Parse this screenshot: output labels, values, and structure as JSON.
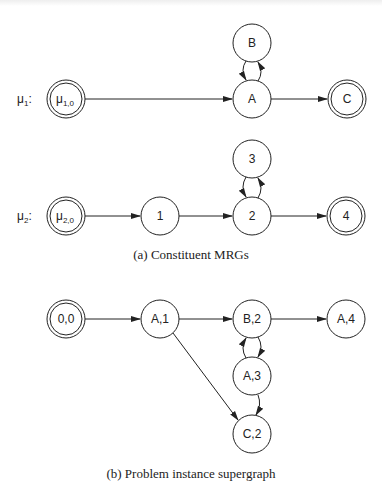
{
  "figure": {
    "part_a": {
      "caption": "(a) Constituent MRGs",
      "rows": [
        {
          "label_main": "μ",
          "label_sub": "1",
          "label_suffix": ":",
          "nodes": [
            {
              "id": "mu10",
              "main": "μ",
              "sub": "1,0",
              "double": true
            },
            {
              "id": "A",
              "main": "A",
              "double": false
            },
            {
              "id": "B",
              "main": "B",
              "double": false
            },
            {
              "id": "C",
              "main": "C",
              "double": true
            }
          ]
        },
        {
          "label_main": "μ",
          "label_sub": "2",
          "label_suffix": ":",
          "nodes": [
            {
              "id": "mu20",
              "main": "μ",
              "sub": "2,0",
              "double": true
            },
            {
              "id": "n1",
              "main": "1",
              "double": false
            },
            {
              "id": "n2",
              "main": "2",
              "double": false
            },
            {
              "id": "n3",
              "main": "3",
              "double": false
            },
            {
              "id": "n4",
              "main": "4",
              "double": true
            }
          ]
        }
      ]
    },
    "part_b": {
      "caption": "(b) Problem instance supergraph",
      "nodes": [
        {
          "id": "00",
          "main": "0,0",
          "double": true
        },
        {
          "id": "A1",
          "main": "A,1",
          "double": false
        },
        {
          "id": "B2",
          "main": "B,2",
          "double": false
        },
        {
          "id": "A4",
          "main": "A,4",
          "double": false
        },
        {
          "id": "A3",
          "main": "A,3",
          "double": false
        },
        {
          "id": "C2",
          "main": "C,2",
          "double": false
        }
      ]
    }
  }
}
